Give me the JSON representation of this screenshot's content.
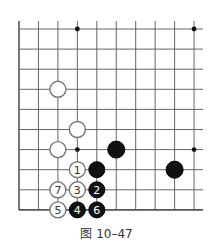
{
  "board": {
    "cols": 10,
    "rows": 10,
    "x0": 19,
    "dx": 19.45,
    "y0": 29,
    "dy": 20.1,
    "right_edge": 203,
    "line_color": "#555555",
    "hoshi": [
      [
        3,
        0
      ],
      [
        9,
        0
      ],
      [
        3,
        6
      ],
      [
        9,
        6
      ]
    ],
    "stones": [
      {
        "color": "white",
        "col": 2,
        "row": 3,
        "label": ""
      },
      {
        "color": "white",
        "col": 3,
        "row": 5,
        "label": ""
      },
      {
        "color": "white",
        "col": 2,
        "row": 6,
        "label": ""
      },
      {
        "color": "black",
        "col": 5,
        "row": 6,
        "label": "",
        "size": "large"
      },
      {
        "color": "black",
        "col": 8,
        "row": 7,
        "label": "",
        "size": "large"
      },
      {
        "color": "white",
        "col": 3,
        "row": 7,
        "label": "1"
      },
      {
        "color": "black",
        "col": 4,
        "row": 7,
        "label": ""
      },
      {
        "color": "white",
        "col": 2,
        "row": 8,
        "label": "7"
      },
      {
        "color": "white",
        "col": 3,
        "row": 8,
        "label": "3"
      },
      {
        "color": "black",
        "col": 4,
        "row": 8,
        "label": "2"
      },
      {
        "color": "white",
        "col": 2,
        "row": 9,
        "label": "5"
      },
      {
        "color": "black",
        "col": 3,
        "row": 9,
        "label": "4"
      },
      {
        "color": "black",
        "col": 4,
        "row": 9,
        "label": "6"
      }
    ]
  },
  "caption": "图 10–47"
}
